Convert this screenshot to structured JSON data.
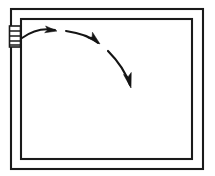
{
  "figure": {
    "type": "line-drawing",
    "canvas": {
      "width": 215,
      "height": 176,
      "background": "#ffffff"
    },
    "line_color": "#1a1a1a",
    "arrow_color": "#141414"
  },
  "frame": {
    "label": "Door frame / opening",
    "outer": {
      "x": 10,
      "y": 8,
      "width": 194,
      "height": 162
    },
    "inner": {
      "x": 20,
      "y": 18,
      "width": 173,
      "height": 142
    }
  },
  "hinge": {
    "label": "Hinge",
    "box": {
      "x": 9,
      "y": 26,
      "width": 11,
      "height": 21
    },
    "rung_count": 4,
    "rungs_y": [
      31,
      36,
      41,
      45
    ]
  },
  "swing_path": {
    "label": "Swing direction arc",
    "segments": [
      {
        "name": "segment-1",
        "d": "M 22 38 C 33 30, 45 28, 55 30"
      },
      {
        "name": "segment-2",
        "d": "M 66 31 C 80 33, 91 37, 98 43"
      },
      {
        "name": "segment-3",
        "d": "M 108 51 C 118 61, 126 73, 130 85"
      }
    ],
    "arrowheads": [
      {
        "name": "arrowhead-1",
        "x": 57,
        "y": 31,
        "angle": 8
      },
      {
        "name": "arrowhead-2",
        "x": 100,
        "y": 44,
        "angle": 42
      },
      {
        "name": "arrowhead-3",
        "x": 131,
        "y": 88,
        "angle": 76
      }
    ]
  }
}
